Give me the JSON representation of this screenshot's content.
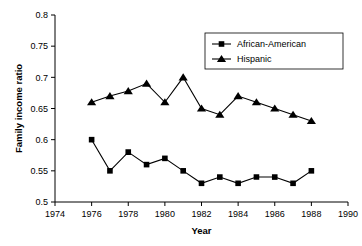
{
  "chart_data": {
    "type": "line",
    "title": "",
    "xlabel": "Year",
    "ylabel": "Family income ratio",
    "xlim": [
      1974,
      1990
    ],
    "ylim": [
      0.5,
      0.8
    ],
    "xticks": [
      1974,
      1976,
      1978,
      1980,
      1982,
      1984,
      1986,
      1988,
      1990
    ],
    "xtick_labels": [
      "1974",
      "1976",
      "1978",
      "1980",
      "1982",
      "1984",
      "1986",
      "1988",
      "1990"
    ],
    "yticks": [
      0.5,
      0.55,
      0.6,
      0.65,
      0.7,
      0.75,
      0.8
    ],
    "ytick_labels": [
      "0.5",
      "0.55",
      "0.6",
      "0.65",
      "0.7",
      "0.75",
      "0.8"
    ],
    "grid": false,
    "legend_position": "top-right",
    "x": [
      1976,
      1977,
      1978,
      1979,
      1980,
      1981,
      1982,
      1983,
      1984,
      1985,
      1986,
      1987,
      1988
    ],
    "series": [
      {
        "name": "African-American",
        "marker": "square",
        "color": "#000000",
        "values": [
          0.6,
          0.55,
          0.58,
          0.56,
          0.57,
          0.55,
          0.53,
          0.54,
          0.53,
          0.54,
          0.54,
          0.53,
          0.55
        ]
      },
      {
        "name": "Hispanic",
        "marker": "triangle",
        "color": "#000000",
        "values": [
          0.66,
          0.67,
          0.678,
          0.69,
          0.66,
          0.7,
          0.65,
          0.64,
          0.67,
          0.66,
          0.65,
          0.64,
          0.63
        ]
      }
    ]
  },
  "legend": {
    "items": [
      {
        "label": "African-American"
      },
      {
        "label": "Hispanic"
      }
    ]
  }
}
